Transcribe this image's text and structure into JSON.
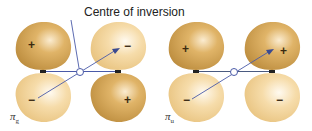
{
  "title": "Centre of inversion",
  "colors": {
    "dark_lobe": "#c99a45",
    "light_lobe": "#f1d49c",
    "bond_line": "#4a5aa8",
    "nucleus": "#222222",
    "background": "#ffffff"
  },
  "diagrams": [
    {
      "id": "pi-g",
      "symbol": "π",
      "subscript": "g",
      "lobes": [
        {
          "position": "top-left",
          "sign": "+",
          "shade": "dark"
        },
        {
          "position": "top-right",
          "sign": "−",
          "shade": "light"
        },
        {
          "position": "bottom-left",
          "sign": "−",
          "shade": "light"
        },
        {
          "position": "bottom-right",
          "sign": "+",
          "shade": "dark"
        }
      ]
    },
    {
      "id": "pi-u",
      "symbol": "π",
      "subscript": "u",
      "lobes": [
        {
          "position": "top-left",
          "sign": "+",
          "shade": "dark"
        },
        {
          "position": "top-right",
          "sign": "+",
          "shade": "dark"
        },
        {
          "position": "bottom-left",
          "sign": "−",
          "shade": "light"
        },
        {
          "position": "bottom-right",
          "sign": "−",
          "shade": "light"
        }
      ]
    }
  ]
}
